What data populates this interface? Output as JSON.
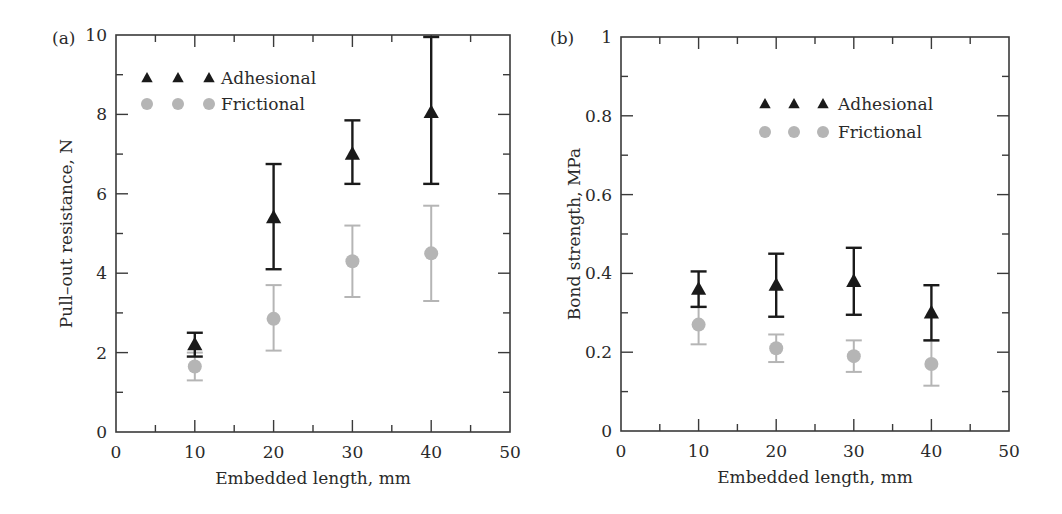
{
  "chart_data": [
    {
      "panel_label": "(a)",
      "type": "scatter",
      "title": "",
      "xlabel": "Embedded length, mm",
      "ylabel": "Pull–out resistance, N",
      "xlim": [
        0,
        50
      ],
      "ylim": [
        0,
        10
      ],
      "xticks": [
        0,
        10,
        20,
        30,
        40,
        50
      ],
      "xtick_labels": [
        "0",
        "10",
        "20",
        "30",
        "40",
        "50"
      ],
      "xminor_step": 5,
      "yticks": [
        0,
        2,
        4,
        6,
        8,
        10
      ],
      "ytick_labels": [
        "0",
        "2",
        "4",
        "6",
        "8",
        "10"
      ],
      "yminor_step": 1,
      "grid": false,
      "legend_position": "upper left",
      "x": [
        10,
        20,
        30,
        40
      ],
      "series": [
        {
          "name": "Adhesional",
          "marker": "triangle",
          "color": "#1a1a1a",
          "values": [
            2.2,
            5.4,
            7.0,
            8.05
          ],
          "err_low": [
            1.9,
            4.1,
            6.25,
            6.25
          ],
          "err_high": [
            2.5,
            6.75,
            7.85,
            9.95
          ]
        },
        {
          "name": "Frictional",
          "marker": "circle",
          "color": "#b5b5b5",
          "values": [
            1.65,
            2.85,
            4.3,
            4.5
          ],
          "err_low": [
            1.3,
            2.05,
            3.4,
            3.3
          ],
          "err_high": [
            2.0,
            3.7,
            5.2,
            5.7
          ]
        }
      ]
    },
    {
      "panel_label": "(b)",
      "type": "scatter",
      "title": "",
      "xlabel": "Embedded length, mm",
      "ylabel": "Bond strength, MPa",
      "xlim": [
        0,
        50
      ],
      "ylim": [
        0,
        1
      ],
      "xticks": [
        0,
        10,
        20,
        30,
        40,
        50
      ],
      "xtick_labels": [
        "0",
        "10",
        "20",
        "30",
        "40",
        "50"
      ],
      "xminor_step": 5,
      "yticks": [
        0,
        0.2,
        0.4,
        0.6,
        0.8,
        1
      ],
      "ytick_labels": [
        "0",
        "0.2",
        "0.4",
        "0.6",
        "0.8",
        "1"
      ],
      "yminor_step": 0.1,
      "grid": false,
      "legend_position": "upper center-right",
      "x": [
        10,
        20,
        30,
        40
      ],
      "series": [
        {
          "name": "Adhesional",
          "marker": "triangle",
          "color": "#1a1a1a",
          "values": [
            0.36,
            0.37,
            0.38,
            0.3
          ],
          "err_low": [
            0.315,
            0.29,
            0.295,
            0.23
          ],
          "err_high": [
            0.405,
            0.45,
            0.465,
            0.37
          ]
        },
        {
          "name": "Frictional",
          "marker": "circle",
          "color": "#b5b5b5",
          "values": [
            0.27,
            0.21,
            0.19,
            0.17
          ],
          "err_low": [
            0.22,
            0.175,
            0.15,
            0.115
          ],
          "err_high": [
            0.315,
            0.245,
            0.23,
            0.23
          ]
        }
      ]
    }
  ],
  "layout": {
    "panels": [
      {
        "plot": {
          "left": 116,
          "top": 35,
          "right": 510,
          "bottom": 432
        },
        "legend": {
          "x": 147,
          "y": 78,
          "marker_dx": 31,
          "text_x": 221,
          "row_gap": 26
        },
        "label_pos": {
          "x": 52,
          "y": 44
        }
      },
      {
        "plot": {
          "left": 621,
          "top": 37,
          "right": 1009,
          "bottom": 431
        },
        "legend": {
          "x": 765,
          "y": 104,
          "marker_dx": 29,
          "text_x": 838,
          "row_gap": 28
        },
        "label_pos": {
          "x": 550,
          "y": 44
        }
      }
    ],
    "axis_color": "#3a3a3a"
  }
}
